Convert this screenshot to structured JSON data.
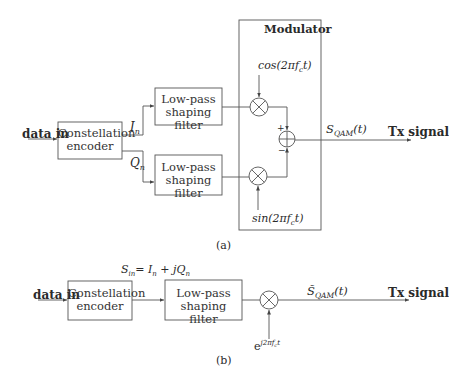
{
  "diagram_a": {
    "caption": "(a)",
    "input_label": "data in",
    "encoder": {
      "line1": "Constellation",
      "line2": "encoder"
    },
    "branch_i_label": "I",
    "branch_i_sub": "n",
    "branch_q_label": "Q",
    "branch_q_sub": "n",
    "filter_top": {
      "line1": "Low-pass",
      "line2": "shaping filter"
    },
    "filter_bottom": {
      "line1": "Low-pass",
      "line2": "shaping filter"
    },
    "modulator_title": "Modulator",
    "carrier_cos": "cos(2πf",
    "carrier_cos_sub": "c",
    "carrier_cos_tail": "t)",
    "carrier_sin": "sin(2πf",
    "carrier_sin_sub": "c",
    "carrier_sin_tail": "t)",
    "adder_plus": "+",
    "adder_minus": "−",
    "output_signal": "S",
    "output_signal_sub": "QAM",
    "output_signal_tail": "(t)",
    "output_label": "Tx signal"
  },
  "diagram_b": {
    "caption": "(b)",
    "input_label": "data in",
    "encoder": {
      "line1": "Constellation",
      "line2": "encoder"
    },
    "symbol_expr": "S",
    "symbol_expr_sub": "in",
    "symbol_expr_mid": "= I",
    "symbol_expr_sub2": "n",
    "symbol_expr_tail": " + jQ",
    "symbol_expr_sub3": "n",
    "filter": {
      "line1": "Low-pass",
      "line2": "shaping filter"
    },
    "carrier": "e",
    "carrier_sup": "j2πf",
    "carrier_sup_sub": "c",
    "carrier_sup_tail": "t",
    "output_signal": "S̃",
    "output_signal_sub": "QAM",
    "output_signal_tail": "(t)",
    "output_label": "Tx signal"
  }
}
